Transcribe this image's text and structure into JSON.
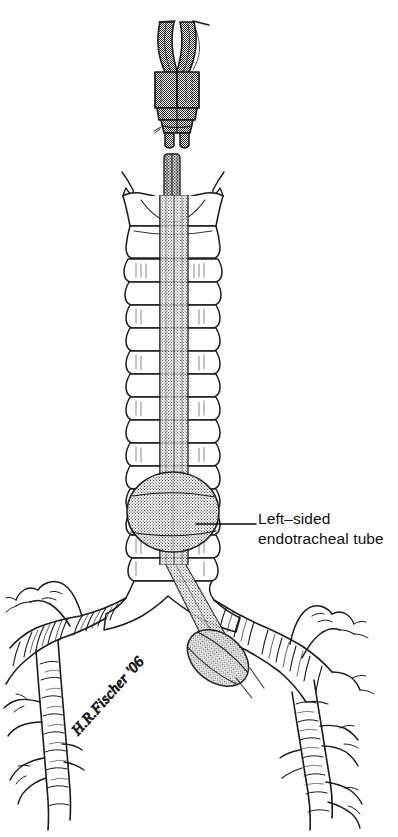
{
  "figure": {
    "background_color": "#ffffff",
    "width": 398,
    "height": 837,
    "line_color": "#1a1a1a",
    "ink_color": "#101010"
  },
  "callout": {
    "line_1": "Left–sided",
    "line_2": "endotracheal tube",
    "leader_line": {
      "x1": 196,
      "y1": 524,
      "x2": 256,
      "y2": 524
    }
  },
  "signature": {
    "text": "H.R.Fischer '06",
    "rotation_deg": -48,
    "x": 78,
    "y": 730
  },
  "shading": {
    "tube_dark": "#8a8a8a",
    "tube_dark_stroke": "#1a1a1a",
    "tube_light": "#bdbdbd",
    "tube_mid": "#a8a8a8",
    "cuff_fill": "#b0b0b0",
    "cartilage_fill": "#ffffff"
  },
  "structures": [
    {
      "name": "double-lumen-connector",
      "label": "Y-shaped double lumen connector",
      "shade": "dark"
    },
    {
      "name": "thyroid-cartilage",
      "label": "Thyroid cartilage (larynx)",
      "shade": "white"
    },
    {
      "name": "cricoid-cartilage",
      "label": "Cricoid cartilage",
      "shade": "white"
    },
    {
      "name": "trachea",
      "label": "Trachea with cartilage rings",
      "shade": "white",
      "ring_count": 14
    },
    {
      "name": "tracheal-cuff",
      "label": "Tracheal cuff (inflated balloon)",
      "shade": "gray"
    },
    {
      "name": "carina",
      "label": "Carina",
      "shade": "white"
    },
    {
      "name": "left-main-bronchus",
      "label": "Left mainstem bronchus",
      "shade": "white"
    },
    {
      "name": "right-main-bronchus",
      "label": "Right mainstem bronchus",
      "shade": "white"
    },
    {
      "name": "bronchial-cuff",
      "label": "Bronchial cuff in left mainstem bronchus",
      "shade": "gray"
    }
  ]
}
